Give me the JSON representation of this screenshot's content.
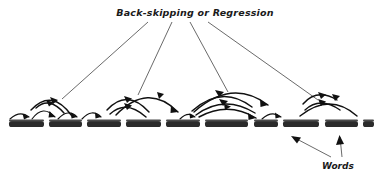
{
  "figure": {
    "title": "Back-skipping or Regression",
    "words_label": "Words",
    "background_color": "#ffffff",
    "ink_color": "#111111",
    "leader_color": "#2a2a2a"
  },
  "text_line": {
    "description": "row of printed words being read",
    "words": [
      "beceane",
      "brashed",
      "general",
      "memory",
      "motored",
      "registered",
      "nere",
      "appease",
      "roman",
      "at"
    ],
    "baseline_y": 128
  },
  "leader_lines": {
    "origin_label": "Back-skipping or Regression",
    "targets": [
      "regression-cluster-1",
      "regression-cluster-2",
      "regression-cluster-3",
      "regression-cluster-4"
    ],
    "count": 4
  },
  "words_pointer": {
    "label": "Words",
    "arrow_count": 2,
    "directions": [
      "up-left",
      "up"
    ]
  },
  "saccade_clusters": [
    {
      "name": "regression-cluster-1",
      "forward_arcs": 3,
      "backward_arcs": 2,
      "note": "short forward saccades with two back-skips"
    },
    {
      "name": "regression-cluster-2",
      "forward_arcs": 2,
      "backward_arcs": 2,
      "note": "long forward saccade with two regressions"
    },
    {
      "name": "regression-cluster-3",
      "forward_arcs": 2,
      "backward_arcs": 2,
      "note": "widest regression span, three nested arcs"
    },
    {
      "name": "regression-cluster-4",
      "forward_arcs": 2,
      "backward_arcs": 2,
      "note": "final cluster at line end"
    }
  ]
}
